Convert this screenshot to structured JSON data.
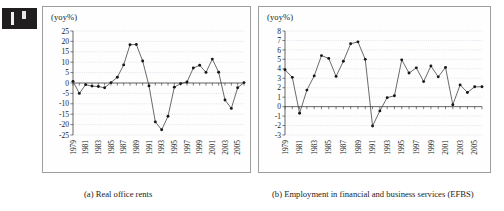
{
  "figure": {
    "unit_label": "(yoy%)",
    "artifact_name": "scan-edge-artifact"
  },
  "panels": [
    {
      "id": "a",
      "caption": "(a) Real office rents",
      "unit_label": "(yoy%)"
    },
    {
      "id": "b",
      "caption": "(b) Employment in financial and business services (EFBS)",
      "unit_label": "(yoy%)"
    }
  ],
  "chart_data": [
    {
      "type": "line",
      "title": "(a) Real office rents",
      "xlabel": "",
      "ylabel": "(yoy%)",
      "ylim": [
        -25,
        25
      ],
      "ytick_step": 5,
      "yticks": [
        25,
        20,
        15,
        10,
        5,
        0,
        -5,
        -10,
        -15,
        -20,
        -25
      ],
      "grid": true,
      "legend": "none",
      "x": [
        1979,
        1980,
        1981,
        1982,
        1983,
        1984,
        1985,
        1986,
        1987,
        1988,
        1989,
        1990,
        1991,
        1992,
        1993,
        1994,
        1995,
        1996,
        1997,
        1998,
        1999,
        2000,
        2001,
        2002,
        2003,
        2004,
        2005,
        2006
      ],
      "xtick_labels": [
        "1979",
        "1981",
        "1983",
        "1985",
        "1987",
        "1989",
        "1991",
        "1993",
        "1995",
        "1997",
        "1999",
        "2001",
        "2003",
        "2005"
      ],
      "values": [
        0.8,
        -5.0,
        -0.8,
        -1.5,
        -1.7,
        -2.3,
        0.2,
        2.8,
        8.7,
        18.4,
        18.5,
        10.6,
        -1.4,
        -18.7,
        -22.5,
        -16.0,
        -2.0,
        -0.3,
        0.5,
        7.2,
        8.5,
        5.1,
        11.5,
        5.2,
        -8.2,
        -12.2,
        -2.3,
        0.2
      ]
    },
    {
      "type": "line",
      "title": "(b) Employment in financial and business services (EFBS)",
      "xlabel": "",
      "ylabel": "(yoy%)",
      "ylim": [
        -3,
        8
      ],
      "ytick_step": 1,
      "yticks": [
        8,
        7,
        6,
        5,
        4,
        3,
        2,
        1,
        0,
        -1,
        -2,
        -3
      ],
      "grid": true,
      "legend": "none",
      "x": [
        1979,
        1980,
        1981,
        1982,
        1983,
        1984,
        1985,
        1986,
        1987,
        1988,
        1989,
        1990,
        1991,
        1992,
        1993,
        1994,
        1995,
        1996,
        1997,
        1998,
        1999,
        2000,
        2001,
        2002,
        2003,
        2004,
        2005,
        2006
      ],
      "xtick_labels": [
        "1979",
        "1981",
        "1983",
        "1985",
        "1987",
        "1989",
        "1991",
        "1993",
        "1995",
        "1997",
        "1999",
        "2001",
        "2003",
        "2005"
      ],
      "values": [
        3.9,
        3.1,
        -0.7,
        1.75,
        3.25,
        5.4,
        5.1,
        3.2,
        4.8,
        6.65,
        6.85,
        5.0,
        -2.05,
        -0.45,
        0.95,
        1.15,
        4.95,
        3.55,
        4.1,
        2.65,
        4.3,
        3.15,
        4.15,
        0.2,
        2.3,
        1.5,
        2.1,
        2.1
      ]
    }
  ]
}
